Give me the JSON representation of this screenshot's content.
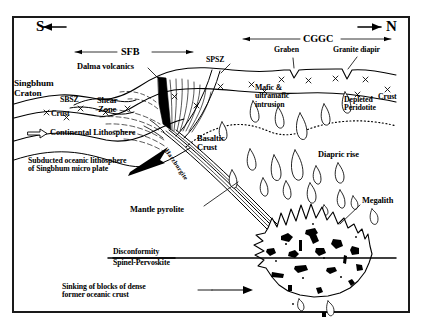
{
  "figure": {
    "type": "geological-cross-section",
    "frame": {
      "color": "#1a1a1a"
    }
  },
  "compass": {
    "south_label": "S",
    "north_label": "N"
  },
  "domains": [
    {
      "key": "sfb",
      "label": "SFB",
      "span": "South: Singhbhum Fold Belt"
    },
    {
      "key": "cggc",
      "label": "CGGC",
      "span": "North: Chotanagpur Granite Gneiss Complex"
    }
  ],
  "labels": {
    "singbhum_craton": "Singbhum\nCraton",
    "sbsz": "SBSZ",
    "spsz": "SPSZ",
    "dalma_volcanics": "Dalma volcanics",
    "shear_zone": "Shear\nZone",
    "crust_left": "Crust",
    "crust_right": "Crust",
    "continental_lithosphere": "Continental Lithosphere",
    "subducted_slab": "Subducted oceanic lithosphere\nof Singbhum micro plate",
    "harzburgite": "Harzburgite",
    "basaltic_crust": "Basaltic\nCrust",
    "graben": "Graben",
    "granite_diapir": "Granite diapir",
    "mafic_ultramafic": "Mafic &\nultramafic\nintrusion",
    "depleted_peridotite": "Depleted\nPeridotite",
    "diapric_rise": "Diapric rise",
    "mantle_pyrolite": "Mantle pyrolite",
    "megalith": "Megalith",
    "disconformity": "Disconformity",
    "spinel_pervoskite": "Spinel-Pervoskite",
    "sinking_blocks": "Sinking of blocks of dense\nformer oceanic crust"
  },
  "colors": {
    "ink": "#000000",
    "frame": "#1a1a1a",
    "fill": "#ffffff",
    "dense_block": "#000000"
  }
}
